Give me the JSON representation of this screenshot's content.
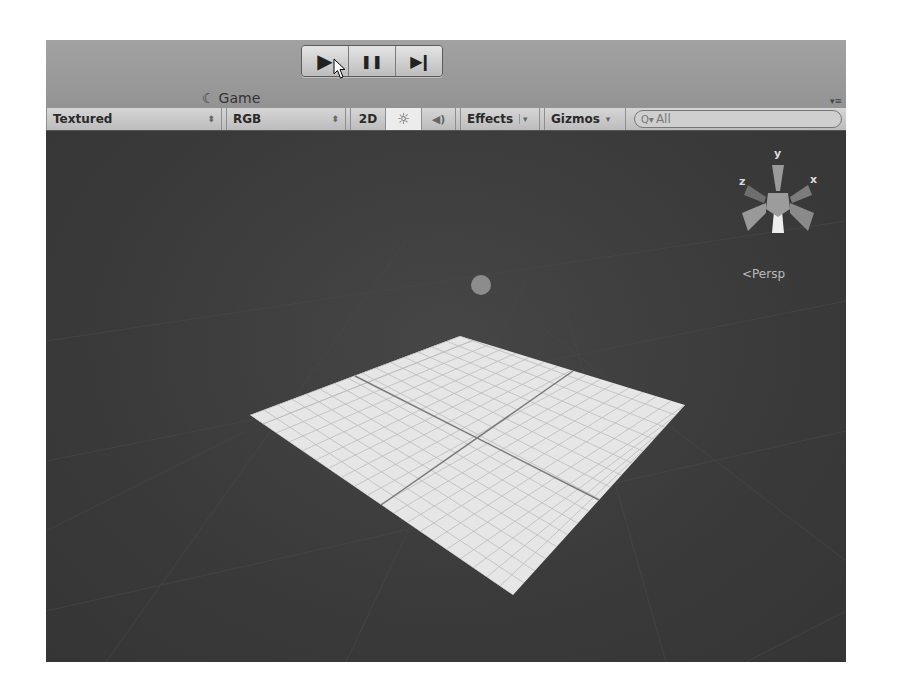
{
  "toolbar_top": {
    "play_icon": "play-icon",
    "pause_icon": "pause-icon",
    "step_icon": "step-icon",
    "play_glyph": "▶",
    "pause_glyph": "❚❚",
    "step_glyph": "▶❙"
  },
  "tabs": [
    {
      "label": "Scene",
      "icon": "#",
      "active": true
    },
    {
      "label": "Game",
      "icon": "☾",
      "active": false
    }
  ],
  "scene_toolbar": {
    "render_mode": "Textured",
    "color_mode": "RGB",
    "toggle_2d": "2D",
    "lighting_glyph": "☼",
    "audio_glyph": "◀)",
    "effects_label": "Effects",
    "gizmos_label": "Gizmos",
    "search_placeholder": "All",
    "search_icon_glyph": "Q▾"
  },
  "scene_view": {
    "gizmo_axes": {
      "y": "y",
      "x": "x",
      "z": "z"
    },
    "projection_label": "Persp",
    "projection_prefix": "<",
    "background_color": "#3b3b3b",
    "plane_color": "#e8e8e8"
  }
}
